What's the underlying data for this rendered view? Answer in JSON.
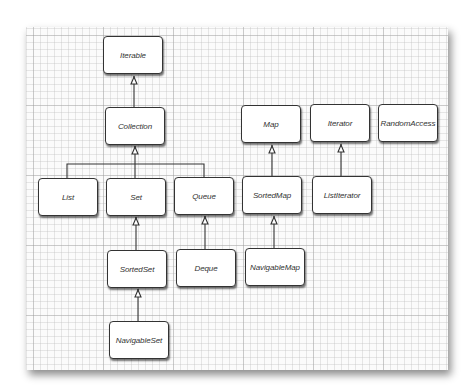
{
  "diagram": {
    "type": "interface-hierarchy",
    "nodes": [
      {
        "id": "iterable",
        "label": "Iterable",
        "x": 103,
        "y": 36
      },
      {
        "id": "collection",
        "label": "Collection",
        "x": 105,
        "y": 107
      },
      {
        "id": "list",
        "label": "List",
        "x": 38,
        "y": 178
      },
      {
        "id": "set",
        "label": "Set",
        "x": 106,
        "y": 178
      },
      {
        "id": "queue",
        "label": "Queue",
        "x": 174,
        "y": 177
      },
      {
        "id": "sortedset",
        "label": "SortedSet",
        "x": 107,
        "y": 250
      },
      {
        "id": "deque",
        "label": "Deque",
        "x": 176,
        "y": 249
      },
      {
        "id": "navigableset",
        "label": "NavigableSet",
        "x": 109,
        "y": 321
      },
      {
        "id": "map",
        "label": "Map",
        "x": 241,
        "y": 105
      },
      {
        "id": "iterator",
        "label": "Iterator",
        "x": 310,
        "y": 104
      },
      {
        "id": "randomaccess",
        "label": "RandomAccess",
        "x": 378,
        "y": 104
      },
      {
        "id": "sortedmap",
        "label": "SortedMap",
        "x": 242,
        "y": 176
      },
      {
        "id": "listiterator",
        "label": "ListIterator",
        "x": 312,
        "y": 176
      },
      {
        "id": "navigablemap",
        "label": "NavigableMap",
        "x": 245,
        "y": 248
      }
    ],
    "edges": [
      {
        "from": "Collection",
        "to": "Iterable"
      },
      {
        "from": "List",
        "to": "Collection"
      },
      {
        "from": "Set",
        "to": "Collection"
      },
      {
        "from": "Queue",
        "to": "Collection"
      },
      {
        "from": "SortedSet",
        "to": "Set"
      },
      {
        "from": "NavigableSet",
        "to": "SortedSet"
      },
      {
        "from": "Deque",
        "to": "Queue"
      },
      {
        "from": "SortedMap",
        "to": "Map"
      },
      {
        "from": "NavigableMap",
        "to": "SortedMap"
      },
      {
        "from": "ListIterator",
        "to": "Iterator"
      }
    ],
    "edge_style": "inheritance-hollow-arrow",
    "background": "graph-paper"
  }
}
